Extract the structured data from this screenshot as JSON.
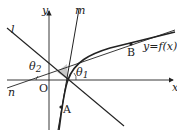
{
  "diagram": {
    "type": "function-graph-with-lines",
    "axes": {
      "x_label": "x",
      "y_label": "y",
      "origin_label": "O"
    },
    "lines": [
      {
        "name": "l",
        "label": "l"
      },
      {
        "name": "m",
        "label": "m"
      },
      {
        "name": "n",
        "label": "n"
      }
    ],
    "curve": {
      "label": "y=f(x)"
    },
    "points": [
      {
        "name": "A",
        "label": "A"
      },
      {
        "name": "B",
        "label": "B"
      }
    ],
    "angles": [
      {
        "name": "theta1",
        "label": "θ",
        "sub": "1"
      },
      {
        "name": "theta2",
        "label": "θ",
        "sub": "2"
      }
    ],
    "colors": {
      "stroke": "#222222",
      "shade": "#c8c8c8"
    }
  }
}
